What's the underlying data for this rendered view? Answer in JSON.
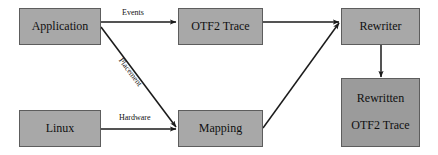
{
  "diagram": {
    "colors": {
      "node_fill_light": "#a8a8a8",
      "node_fill_dark": "#9b9b9b",
      "node_border": "#5d5d5d",
      "edge_stroke": "#1b1b1b",
      "background": "#ffffff",
      "text": "#101010"
    },
    "nodes": [
      {
        "id": "application",
        "label": "Application"
      },
      {
        "id": "otf2-trace",
        "label": "OTF2 Trace"
      },
      {
        "id": "rewriter",
        "label": "Rewriter"
      },
      {
        "id": "linux",
        "label": "Linux"
      },
      {
        "id": "mapping",
        "label": "Mapping"
      },
      {
        "id": "rewritten-otf2-trace",
        "label_line1": "Rewritten",
        "label_line2": "OTF2 Trace"
      }
    ],
    "edges": [
      {
        "id": "application-to-otf2-trace",
        "label": "Events"
      },
      {
        "id": "application-to-mapping",
        "label": "Placement"
      },
      {
        "id": "linux-to-mapping",
        "label": "Hardware"
      },
      {
        "id": "otf2-trace-to-rewriter",
        "label": ""
      },
      {
        "id": "mapping-to-rewriter",
        "label": ""
      },
      {
        "id": "rewriter-to-rewritten",
        "label": ""
      }
    ]
  }
}
